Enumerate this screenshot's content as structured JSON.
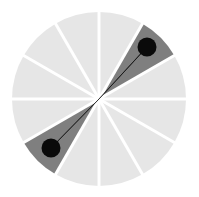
{
  "figure": {
    "title": "Radial sector gauge",
    "width": 199,
    "height": 197,
    "background_color": "#ffffff"
  },
  "geometry": {
    "center_x": 99,
    "center_y": 99,
    "radius": 87,
    "sector_count": 12,
    "sector_span_degrees": 30,
    "divider_width": 3,
    "needle_width": 5,
    "marker_radius": 9.5
  },
  "colors": {
    "sector_default": "#e6e6e6",
    "sector_highlight": "#7f7f7f",
    "divider": "#ffffff",
    "needle": "#0a0a0a",
    "marker": "#0a0a0a",
    "background": "#ffffff"
  },
  "labels": {
    "chart_title": "Radial sector gauge",
    "needle_label": "needle",
    "marker_a_label": "upper-right end marker",
    "marker_b_label": "lower-left end marker",
    "circle_label": "gauge face"
  },
  "chart_data": {
    "type": "pie",
    "title": "Radial sector gauge",
    "subtitle": "",
    "xlabel": "",
    "ylabel": "",
    "grid": false,
    "legend_position": "none",
    "categories": [
      "S1",
      "S2",
      "S3",
      "S4",
      "S5",
      "S6",
      "S7",
      "S8",
      "S9",
      "S10",
      "S11",
      "S12"
    ],
    "values": [
      8.333,
      8.333,
      8.333,
      8.333,
      8.333,
      8.333,
      8.333,
      8.333,
      8.333,
      8.333,
      8.333,
      8.333
    ],
    "sectors": [
      {
        "index": 0,
        "label": "S1",
        "start_deg": 0,
        "end_deg": 30,
        "highlighted": false,
        "fill": "#e6e6e6"
      },
      {
        "index": 1,
        "label": "S2",
        "start_deg": 30,
        "end_deg": 60,
        "highlighted": true,
        "fill": "#7f7f7f"
      },
      {
        "index": 2,
        "label": "S3",
        "start_deg": 60,
        "end_deg": 90,
        "highlighted": false,
        "fill": "#e6e6e6"
      },
      {
        "index": 3,
        "label": "S4",
        "start_deg": 90,
        "end_deg": 120,
        "highlighted": false,
        "fill": "#e6e6e6"
      },
      {
        "index": 4,
        "label": "S5",
        "start_deg": 120,
        "end_deg": 150,
        "highlighted": false,
        "fill": "#e6e6e6"
      },
      {
        "index": 5,
        "label": "S6",
        "start_deg": 150,
        "end_deg": 180,
        "highlighted": false,
        "fill": "#e6e6e6"
      },
      {
        "index": 6,
        "label": "S7",
        "start_deg": 180,
        "end_deg": 210,
        "highlighted": false,
        "fill": "#e6e6e6"
      },
      {
        "index": 7,
        "label": "S8",
        "start_deg": 210,
        "end_deg": 240,
        "highlighted": true,
        "fill": "#7f7f7f"
      },
      {
        "index": 8,
        "label": "S9",
        "start_deg": 240,
        "end_deg": 270,
        "highlighted": false,
        "fill": "#e6e6e6"
      },
      {
        "index": 9,
        "label": "S10",
        "start_deg": 270,
        "end_deg": 300,
        "highlighted": false,
        "fill": "#e6e6e6"
      },
      {
        "index": 10,
        "label": "S11",
        "start_deg": 300,
        "end_deg": 330,
        "highlighted": false,
        "fill": "#e6e6e6"
      },
      {
        "index": 11,
        "label": "S12",
        "start_deg": 330,
        "end_deg": 360,
        "highlighted": false,
        "fill": "#e6e6e6"
      }
    ],
    "needle": {
      "angle_deg": 45,
      "double_ended": true,
      "length_fraction": 0.63,
      "end_points": [
        {
          "id": "marker-a",
          "angle_deg": 45,
          "x": 147,
          "y": 47,
          "radius": 9.5
        },
        {
          "id": "marker-b",
          "angle_deg": 225,
          "x": 51,
          "y": 148,
          "radius": 9.5
        }
      ]
    },
    "annotations": []
  }
}
